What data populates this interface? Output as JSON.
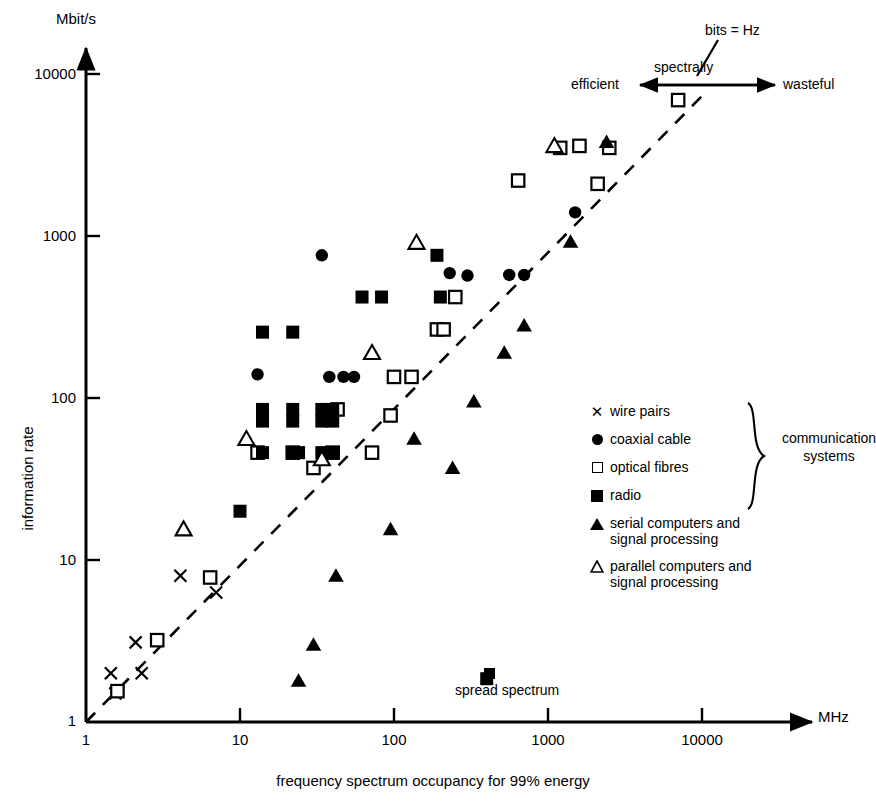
{
  "figure": {
    "y_unit_label": "Mbit/s",
    "x_unit_label": "MHz",
    "y_axis_title": "information rate",
    "x_axis_title": "frequency spectrum occupancy for 99% energy"
  },
  "annotations": {
    "bits_equals_hz": "bits = Hz",
    "spectrally": "spectrally",
    "efficient": "efficient",
    "wasteful": "wasteful",
    "spread_spectrum": "spread spectrum"
  },
  "legend": {
    "group_label": "communication\nsystems",
    "group_label_line1": "communication",
    "group_label_line2": "systems",
    "items": [
      {
        "marker": "cross",
        "label": "wire pairs",
        "label_line2": ""
      },
      {
        "marker": "filled-circle",
        "label": "coaxial cable",
        "label_line2": ""
      },
      {
        "marker": "open-square",
        "label": "optical fibres",
        "label_line2": ""
      },
      {
        "marker": "filled-square",
        "label": "radio",
        "label_line2": ""
      },
      {
        "marker": "filled-triangle",
        "label": "serial computers and",
        "label_line2": "signal processing"
      },
      {
        "marker": "open-triangle",
        "label": "parallel computers and",
        "label_line2": "signal processing"
      }
    ]
  },
  "chart_data": {
    "type": "scatter",
    "title": "",
    "xlabel": "frequency spectrum occupancy for 99% energy",
    "ylabel": "information rate",
    "xunit": "MHz",
    "yunit": "Mbit/s",
    "xscale": "log",
    "yscale": "log",
    "xlim": [
      1,
      10000
    ],
    "ylim": [
      1,
      10000
    ],
    "xticks": [
      1,
      10,
      100,
      1000,
      10000
    ],
    "yticks": [
      1,
      10,
      100,
      1000,
      10000
    ],
    "xtick_labels": [
      "1",
      "10",
      "100",
      "1000",
      "10000"
    ],
    "ytick_labels": [
      "1",
      "10",
      "100",
      "1000",
      "10000"
    ],
    "grid": false,
    "legend_position": "right-middle",
    "reference_line": {
      "label": "bits = Hz",
      "style": "dashed",
      "from": [
        1,
        1
      ],
      "to": [
        10000,
        10000
      ]
    },
    "series": [
      {
        "name": "wire pairs",
        "marker": "cross",
        "points": [
          [
            1.45,
            2.0
          ],
          [
            1.55,
            1.5
          ],
          [
            2.1,
            3.1
          ],
          [
            2.3,
            2.0
          ],
          [
            4.1,
            8.0
          ],
          [
            7.0,
            6.3
          ],
          [
            24,
            46
          ]
        ]
      },
      {
        "name": "coaxial cable",
        "marker": "filled-circle",
        "points": [
          [
            13,
            140
          ],
          [
            34,
            760
          ],
          [
            38,
            135
          ],
          [
            47,
            135
          ],
          [
            55,
            135
          ],
          [
            230,
            590
          ],
          [
            300,
            570
          ],
          [
            560,
            575
          ],
          [
            700,
            575
          ],
          [
            1500,
            1400
          ]
        ]
      },
      {
        "name": "optical fibres",
        "marker": "open-square",
        "points": [
          [
            1.6,
            1.55
          ],
          [
            2.9,
            3.2
          ],
          [
            6.4,
            7.8
          ],
          [
            13,
            46
          ],
          [
            22,
            46
          ],
          [
            30,
            37
          ],
          [
            40,
            46
          ],
          [
            43,
            85
          ],
          [
            72,
            46
          ],
          [
            95,
            78
          ],
          [
            100,
            135
          ],
          [
            130,
            135
          ],
          [
            190,
            265
          ],
          [
            210,
            265
          ],
          [
            250,
            420
          ],
          [
            640,
            2200
          ],
          [
            1200,
            3500
          ],
          [
            1600,
            3600
          ],
          [
            2100,
            2100
          ],
          [
            2500,
            3500
          ],
          [
            7000,
            6900
          ]
        ]
      },
      {
        "name": "radio",
        "marker": "filled-square",
        "points": [
          [
            10,
            20
          ],
          [
            14,
            255
          ],
          [
            14,
            85
          ],
          [
            14,
            72
          ],
          [
            14,
            46
          ],
          [
            22,
            255
          ],
          [
            22,
            85
          ],
          [
            22,
            72
          ],
          [
            22,
            46
          ],
          [
            24,
            46
          ],
          [
            34,
            85
          ],
          [
            34,
            72
          ],
          [
            34,
            46
          ],
          [
            40,
            85
          ],
          [
            40,
            72
          ],
          [
            40,
            46
          ],
          [
            62,
            420
          ],
          [
            83,
            420
          ],
          [
            190,
            760
          ],
          [
            200,
            420
          ],
          [
            400,
            1.85
          ]
        ]
      },
      {
        "name": "serial computers and signal processing",
        "marker": "filled-triangle",
        "points": [
          [
            24,
            1.8
          ],
          [
            30,
            3.0
          ],
          [
            42,
            8.0
          ],
          [
            95,
            15.5
          ],
          [
            135,
            56
          ],
          [
            240,
            37
          ],
          [
            330,
            95
          ],
          [
            520,
            190
          ],
          [
            700,
            280
          ],
          [
            1400,
            920
          ],
          [
            2400,
            3800
          ]
        ]
      },
      {
        "name": "parallel computers and signal processing",
        "marker": "open-triangle",
        "points": [
          [
            4.3,
            15.5
          ],
          [
            11,
            56
          ],
          [
            34,
            42
          ],
          [
            72,
            190
          ],
          [
            140,
            910
          ],
          [
            1100,
            3600
          ]
        ]
      }
    ]
  }
}
